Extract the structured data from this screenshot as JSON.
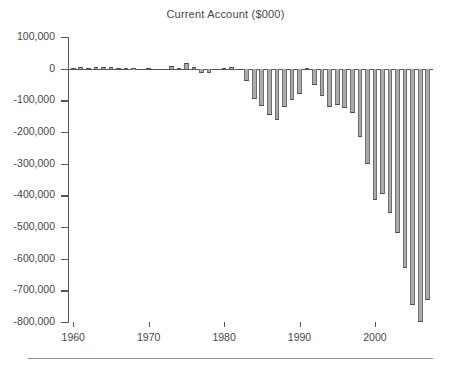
{
  "chart_data": {
    "type": "bar",
    "title": "Current Account ($000)",
    "xlabel": "",
    "ylabel": "",
    "ylim": [
      -800000,
      100000
    ],
    "xlim": [
      1959.3,
      2007.7
    ],
    "ytick_labels": [
      "100,000",
      "0",
      "-100,000",
      "-200,000",
      "-300,000",
      "-400,000",
      "-500,000",
      "-600,000",
      "-700,000",
      "-800,000"
    ],
    "ytick_values": [
      100000,
      0,
      -100000,
      -200000,
      -300000,
      -400000,
      -500000,
      -600000,
      -700000,
      -800000
    ],
    "xtick_labels": [
      "1960",
      "1970",
      "1980",
      "1990",
      "2000"
    ],
    "xtick_values": [
      1960,
      1970,
      1980,
      1990,
      2000
    ],
    "grid": false,
    "legend": false,
    "bar_color": "#ababab",
    "bar_edge_color": "#4c4c4c",
    "axis_color": "#55555a",
    "categories": [
      1960,
      1961,
      1962,
      1963,
      1964,
      1965,
      1966,
      1967,
      1968,
      1969,
      1970,
      1971,
      1972,
      1973,
      1974,
      1975,
      1976,
      1977,
      1978,
      1979,
      1980,
      1981,
      1982,
      1983,
      1984,
      1985,
      1986,
      1987,
      1988,
      1989,
      1990,
      1991,
      1992,
      1993,
      1994,
      1995,
      1996,
      1997,
      1998,
      1999,
      2000,
      2001,
      2002,
      2003,
      2004,
      2005,
      2006,
      2007
    ],
    "values": [
      2824,
      3822,
      3387,
      4414,
      6823,
      5431,
      3031,
      2583,
      611,
      399,
      2331,
      -1433,
      -5795,
      7140,
      1962,
      18116,
      4295,
      -14335,
      -15143,
      -285,
      2317,
      5030,
      -5536,
      -38691,
      -94344,
      -118155,
      -147177,
      -160655,
      -121153,
      -99486,
      -78969,
      2895,
      -51613,
      -84805,
      -121612,
      -113567,
      -124764,
      -140726,
      -215062,
      -301630,
      -416339,
      -396603,
      -457248,
      -519088,
      -628517,
      -745774,
      -800621,
      -731214
    ],
    "units": "thousands of dollars"
  },
  "chart": {
    "title": "Current Account ($000)"
  }
}
